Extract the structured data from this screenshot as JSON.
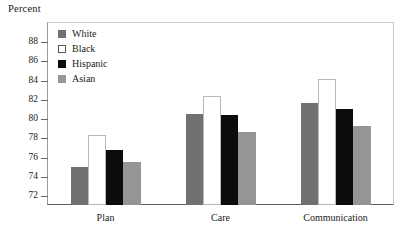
{
  "chart_data": {
    "type": "bar",
    "title": "",
    "xlabel": "",
    "ylabel": "Percent",
    "ylim": [
      72,
      88
    ],
    "yticks": [
      72,
      74,
      76,
      78,
      80,
      82,
      84,
      86,
      88
    ],
    "grid": false,
    "legend_position": "top-left",
    "categories": [
      "Plan",
      "Care",
      "Communication"
    ],
    "series": [
      {
        "name": "White",
        "color": "#717171",
        "values": [
          75.0,
          80.5,
          81.7
        ]
      },
      {
        "name": "Black",
        "color": "#ffffff",
        "values": [
          78.3,
          82.4,
          84.2
        ]
      },
      {
        "name": "Hispanic",
        "color": "#0c0c0c",
        "values": [
          76.8,
          80.4,
          81.0
        ]
      },
      {
        "name": "Asian",
        "color": "#959595",
        "values": [
          75.5,
          78.6,
          79.3
        ]
      }
    ]
  },
  "axis": {
    "y_title": "Percent",
    "tick_labels": [
      "88",
      "86",
      "84",
      "82",
      "80",
      "78",
      "76",
      "74",
      "72"
    ]
  },
  "legend": {
    "items": [
      {
        "label": "White",
        "swatch": "gray-swatch"
      },
      {
        "label": "Black",
        "swatch": "white-swatch"
      },
      {
        "label": "Hispanic",
        "swatch": "black-swatch"
      },
      {
        "label": "Asian",
        "swatch": "light-gray-swatch"
      }
    ]
  },
  "groups": {
    "labels": [
      "Plan",
      "Care",
      "Communication"
    ]
  }
}
